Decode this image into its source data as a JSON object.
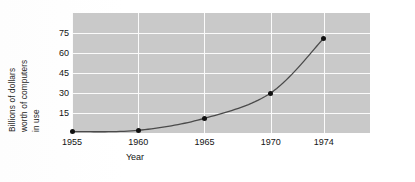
{
  "chart_data": {
    "type": "line",
    "title": "",
    "xlabel": "Year",
    "ylabel_lines": [
      "Billions of dollars",
      "worth of computers",
      "in use"
    ],
    "ylabel": "Billions of dollars worth of computers in use",
    "x": [
      1955,
      1960,
      1965,
      1970,
      1974
    ],
    "xtick_labels": [
      "1955",
      "1960",
      "1965",
      "1970",
      "1974"
    ],
    "values": [
      1,
      2,
      11,
      30,
      71
    ],
    "ytick_labels": [
      "15",
      "30",
      "45",
      "60",
      "75"
    ],
    "yticks": [
      15,
      30,
      45,
      60,
      75
    ],
    "ylim": [
      0,
      90
    ],
    "xlim": [
      1955,
      1977.5
    ],
    "grid": "horizontal-and-vertical",
    "legend": "none",
    "marker": "filled-circle",
    "series": [
      {
        "name": "Value of computers in use",
        "values": [
          1,
          2,
          11,
          30,
          71
        ]
      }
    ],
    "colors": {
      "panel_background": "#c9c9c9",
      "gridline": "#fbfbfb",
      "line": "#4a4a4a",
      "marker": "#111111",
      "text": "#141414",
      "page_background": "#ffffff"
    }
  }
}
